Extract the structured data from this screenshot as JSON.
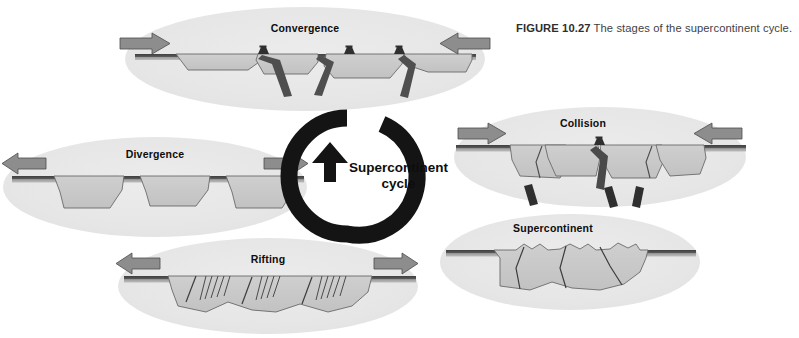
{
  "figure": {
    "number_label": "FIGURE 10.27",
    "caption_text": "The stages of the supercontinent cycle.",
    "background_color": "#ffffff"
  },
  "center": {
    "line1": "Supercontinent",
    "line2": "cycle",
    "ring_color": "#141414",
    "direction": "counterclockwise"
  },
  "palette": {
    "ellipse_fill": "#e6e6e6",
    "continent_fill": "#c9c9c9",
    "continent_stroke": "#555555",
    "lithosphere_dark": "#4a4a4a",
    "lithosphere_mid": "#9a9a9a",
    "slab_dark": "#3a3a3a",
    "arrow_fill": "#8d8d8d",
    "arrow_stroke": "#4d4d4d",
    "label_color": "#0d0d0d",
    "caption_color": "#3b3b3b"
  },
  "stages": [
    {
      "id": "convergence",
      "label": "Convergence",
      "order": 1,
      "label_x": 305,
      "label_y": 22,
      "arrows": [
        {
          "side": "left",
          "direction": "right"
        },
        {
          "side": "right",
          "direction": "left"
        }
      ],
      "features": [
        "subduction-zones",
        "volcanoes",
        "separate-continents",
        "closing-ocean"
      ],
      "volcano_count": 3,
      "continent_count": 4
    },
    {
      "id": "divergence",
      "label": "Divergence",
      "order": 2,
      "label_x": 155,
      "label_y": 148,
      "arrows": [
        {
          "side": "left",
          "direction": "left"
        },
        {
          "side": "right",
          "direction": "right"
        }
      ],
      "features": [
        "spreading-ridges",
        "separate-continents",
        "widening-ocean"
      ],
      "ridge_count": 3,
      "continent_count": 3
    },
    {
      "id": "collision",
      "label": "Collision",
      "order": 3,
      "label_x": 583,
      "label_y": 117,
      "arrows": [
        {
          "side": "left",
          "direction": "right"
        },
        {
          "side": "right",
          "direction": "left"
        }
      ],
      "features": [
        "continental-collision",
        "detached-slabs",
        "suture-zones",
        "mountain-building"
      ],
      "slab_fragment_count": 3,
      "continent_count": 4
    },
    {
      "id": "supercontinent",
      "label": "Supercontinent",
      "order": 4,
      "label_x": 553,
      "label_y": 222,
      "arrows": [],
      "features": [
        "single-landmass",
        "internal-sutures",
        "eroded-mountains"
      ],
      "suture_count": 3,
      "continent_count": 1
    },
    {
      "id": "rifting",
      "label": "Rifting",
      "order": 5,
      "label_x": 268,
      "label_y": 253,
      "arrows": [
        {
          "side": "left",
          "direction": "left"
        },
        {
          "side": "right",
          "direction": "right"
        }
      ],
      "features": [
        "normal-faults",
        "fault-blocks",
        "breakup-of-supercontinent"
      ],
      "rift_zone_count": 3,
      "continent_count": 1
    }
  ]
}
